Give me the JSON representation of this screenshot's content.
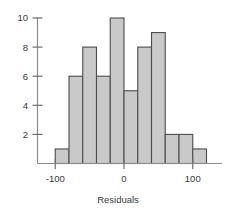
{
  "chart_data": {
    "type": "bar",
    "subtype": "histogram",
    "title": "",
    "xlabel": "Residuals",
    "ylabel": "",
    "categories": [
      "-100 to -80",
      "-80 to -60",
      "-60 to -40",
      "-40 to -20",
      "-20 to 0",
      "0 to 20",
      "20 to 40",
      "40 to 60",
      "60 to 80",
      "80 to 100",
      "100 to 120"
    ],
    "bin_edges": [
      -100,
      -80,
      -60,
      -40,
      -20,
      0,
      20,
      40,
      60,
      80,
      100,
      120
    ],
    "values": [
      1,
      6,
      8,
      6,
      10,
      5,
      8,
      9,
      2,
      2,
      1
    ],
    "bin_width": 20,
    "xlim": [
      -140,
      140
    ],
    "ylim": [
      0,
      10.6
    ],
    "x_ticks": [
      -100,
      0,
      100
    ],
    "x_tick_labels": [
      "-100",
      "0",
      "100"
    ],
    "y_ticks": [
      2,
      4,
      6,
      8,
      10
    ],
    "y_tick_labels": [
      "2",
      "4",
      "6",
      "8",
      "10"
    ],
    "grid": false,
    "legend": "none",
    "bar_fill_color": "#c9c9c9",
    "bar_edge_color": "#4c4c4e",
    "axis_color": "#8c8c8e",
    "text_color": "#39393b"
  }
}
